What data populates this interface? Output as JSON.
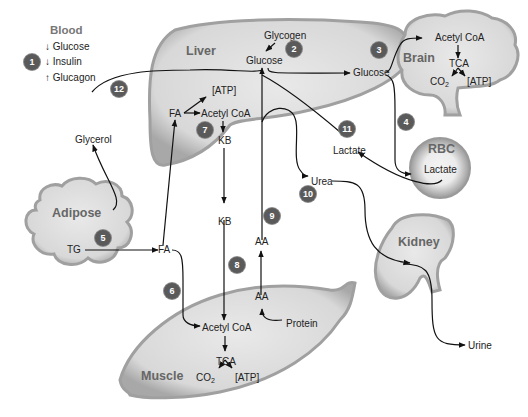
{
  "legend": {
    "title": "Blood",
    "items": [
      {
        "arrow": "↓",
        "label": "Glucose"
      },
      {
        "arrow": "↓",
        "label": "Insulin"
      },
      {
        "arrow": "↑",
        "label": "Glucagon"
      }
    ],
    "badge": "1"
  },
  "organs": {
    "liver": "Liver",
    "brain": "Brain",
    "rbc": "RBC",
    "adipose": "Adipose",
    "kidney": "Kidney",
    "muscle": "Muscle"
  },
  "labels": {
    "liver_glycogen": "Glycogen",
    "liver_glucose": "Glucose",
    "liver_atp": "[ATP]",
    "liver_fa": "FA",
    "liver_acetyl_coa": "Acetyl CoA",
    "liver_kb": "KB",
    "blood_glucose": "Glucose",
    "brain_acetyl_coa": "Acetyl CoA",
    "brain_tca": "TCA",
    "brain_co2": "CO",
    "brain_co2_sub": "2",
    "brain_atp": "[ATP]",
    "rbc_lactate": "Lactate",
    "blood_lactate": "Lactate",
    "urea": "Urea",
    "glycerol": "Glycerol",
    "adipose_tg": "TG",
    "blood_fa": "FA",
    "blood_kb": "KB",
    "blood_aa": "AA",
    "muscle_aa": "AA",
    "muscle_protein": "Protein",
    "muscle_acetyl_coa": "Acetyl CoA",
    "muscle_tca": "TCA",
    "muscle_co2": "CO",
    "muscle_co2_sub": "2",
    "muscle_atp": "[ATP]",
    "urine": "Urine"
  },
  "badges": [
    "1",
    "2",
    "3",
    "4",
    "5",
    "6",
    "7",
    "8",
    "9",
    "10",
    "11",
    "12"
  ],
  "colors": {
    "organ_fill": "#dcdcdc",
    "organ_edge": "#9a9a9a",
    "badge": "#5a5a5a",
    "line": "#111111"
  }
}
